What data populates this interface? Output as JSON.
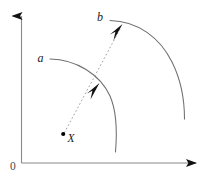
{
  "figure": {
    "background_color": "#ffffff",
    "axis_color": "#808080",
    "curve_color": "#6e6e6e",
    "ray_color": "#9a9a9a",
    "marker_color": "#000000",
    "label_color": "#1a1a1a",
    "origin_label": "0",
    "labels": {
      "inner_wavefront": "a",
      "outer_wavefront": "b",
      "source_point": "X"
    },
    "axes": {
      "y_axis_name": "vertical-axis",
      "x_axis_name": "horizontal-axis",
      "y_arrow": "arrow-up",
      "x_arrow": "arrow-right"
    },
    "elements": {
      "inner_arc_name": "wavefront-arc-a",
      "outer_arc_name": "wavefront-arc-b",
      "ray_name": "propagation-ray",
      "arrow_inner": "ray-arrowhead-inner",
      "arrow_outer": "ray-arrowhead-outer",
      "source_dot": "source-point-marker"
    }
  }
}
